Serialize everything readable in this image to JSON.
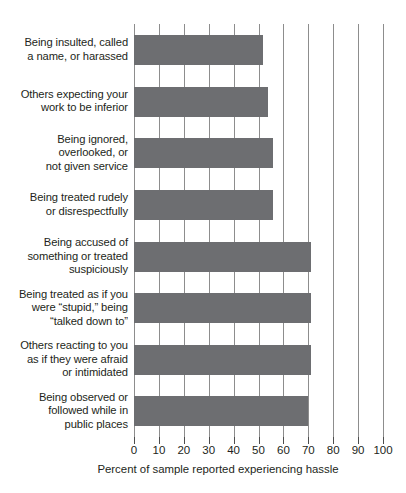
{
  "chart_data": {
    "type": "bar",
    "orientation": "horizontal",
    "title": "",
    "subtitle": "",
    "xlabel": "Percent of sample reported experiencing hassle",
    "ylabel": "",
    "xlim": [
      0,
      100
    ],
    "xticks": [
      0,
      10,
      20,
      30,
      40,
      50,
      60,
      70,
      80,
      90,
      100
    ],
    "xtick_labels": [
      "0",
      "10",
      "20",
      "30",
      "40",
      "50",
      "60",
      "70",
      "80",
      "90",
      "100"
    ],
    "grid": "vertical",
    "legend": "none",
    "bar_color": "#6d6e71",
    "categories": [
      "Being insulted, called\na name, or harassed",
      "Others expecting your\nwork to be inferior",
      "Being ignored,\noverlooked, or\nnot given service",
      "Being treated rudely\nor disrespectfully",
      "Being accused of\nsomething or treated\nsuspiciously",
      "Being treated as if you\nwere “stupid,” being\n“talked down to”",
      "Others reacting to you\nas if they were afraid\nor intimidated",
      "Being observed or\nfollowed while in\npublic places"
    ],
    "values": [
      52,
      54,
      56,
      56,
      71,
      71,
      71,
      70
    ],
    "items": [
      {
        "label_lines": [
          "Being insulted, called",
          "a name, or harassed"
        ],
        "label": "Being insulted, called a name, or harassed",
        "value": 52
      },
      {
        "label_lines": [
          "Others expecting your",
          "work to be inferior"
        ],
        "label": "Others expecting your work to be inferior",
        "value": 54
      },
      {
        "label_lines": [
          "Being ignored,",
          "overlooked, or",
          "not given service"
        ],
        "label": "Being ignored, overlooked, or not given service",
        "value": 56
      },
      {
        "label_lines": [
          "Being treated rudely",
          "or disrespectfully"
        ],
        "label": "Being treated rudely or disrespectfully",
        "value": 56
      },
      {
        "label_lines": [
          "Being accused of",
          "something or treated",
          "suspiciously"
        ],
        "label": "Being accused of something or treated suspiciously",
        "value": 71
      },
      {
        "label_lines": [
          "Being treated as if you",
          "were “stupid,” being",
          "“talked down to”"
        ],
        "label": "Being treated as if you were “stupid,” being “talked down to”",
        "value": 71
      },
      {
        "label_lines": [
          "Others reacting to you",
          "as if they were afraid",
          "or intimidated"
        ],
        "label": "Others reacting to you as if they were afraid or intimidated",
        "value": 71
      },
      {
        "label_lines": [
          "Being observed or",
          "followed while in",
          "public places"
        ],
        "label": "Being observed or followed while in public places",
        "value": 70
      }
    ]
  }
}
